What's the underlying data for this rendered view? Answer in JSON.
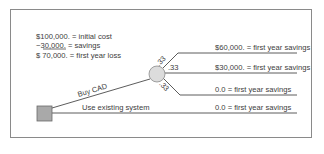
{
  "diagram": {
    "type": "decision-tree",
    "cost_calculation": {
      "lines": [
        {
          "amount": "$100,000.",
          "label": "= initial cost"
        },
        {
          "amount": "−30,000.",
          "label": "= savings"
        },
        {
          "amount": "$  70,000.",
          "label": "= first year loss"
        }
      ]
    },
    "decision_node": {
      "shape": "square",
      "fill": "#a9a9a9"
    },
    "chance_node": {
      "shape": "circle",
      "fill": "#dcdcdc"
    },
    "branches": {
      "buy_cad": {
        "label": "Buy CAD",
        "outcomes": [
          {
            "probability": ".33",
            "value": "$60,000. = first year savings"
          },
          {
            "probability": ".33",
            "value": "$30,000. = first year savings"
          },
          {
            "probability": ".33",
            "value": "0.0 = first year savings"
          }
        ]
      },
      "use_existing": {
        "label": "Use existing system",
        "value": "0.0 = first year savings"
      }
    },
    "colors": {
      "line": "#4a4a4a",
      "text": "#3c3c3c",
      "frame": "#8a8a8a"
    }
  }
}
